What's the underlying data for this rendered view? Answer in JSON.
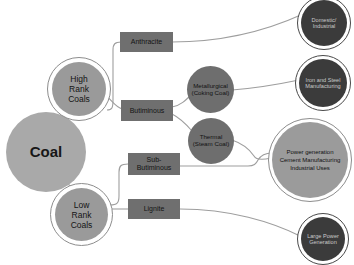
{
  "diagram": {
    "colors": {
      "root_fill": "#a9a9a9",
      "rank_fill": "#9a9a9a",
      "rect_fill": "#6f6f6f",
      "mid_circle_fill": "#6e6e6e",
      "dark_circle_fill": "#3b3b3b",
      "big_circle_fill": "#9b9b9b",
      "edge_stroke": "#9e9e9e",
      "ring_stroke": "#8d8d8d",
      "background": "#ffffff"
    },
    "nodes": {
      "root": {
        "label": "Coal"
      },
      "high_rank": {
        "line1": "High",
        "line2": "Rank",
        "line3": "Coals"
      },
      "low_rank": {
        "line1": "Low",
        "line2": "Rank",
        "line3": "Coals"
      },
      "anthracite": {
        "label": "Anthracite"
      },
      "bituminous": {
        "label": "Butiminous"
      },
      "sub_bituminous": {
        "line1": "Sub-",
        "line2": "Butiminous"
      },
      "lignite": {
        "label": "Lignite"
      },
      "metallurgical": {
        "line1": "Metallurgical",
        "line2": "(Coking Coal)"
      },
      "thermal": {
        "line1": "Thermal",
        "line2": "(Steam Coal)"
      },
      "domestic": {
        "line1": "Domestic/",
        "line2": "Industrial"
      },
      "iron_steel": {
        "line1": "Iron and Steel",
        "line2": "Manufacturing"
      },
      "power_cement": {
        "line1": "Power generation",
        "line2": "Cement Manufacturing",
        "line3": "Industrial Uses"
      },
      "large_power": {
        "line1": "Large Power",
        "line2": "Generation"
      }
    },
    "edges": [
      {
        "from": "root",
        "to": "high_rank"
      },
      {
        "from": "root",
        "to": "low_rank"
      },
      {
        "from": "high_rank",
        "to": "anthracite"
      },
      {
        "from": "high_rank",
        "to": "bituminous"
      },
      {
        "from": "low_rank",
        "to": "sub_bituminous"
      },
      {
        "from": "low_rank",
        "to": "lignite"
      },
      {
        "from": "bituminous",
        "to": "metallurgical"
      },
      {
        "from": "bituminous",
        "to": "thermal"
      },
      {
        "from": "anthracite",
        "to": "domestic"
      },
      {
        "from": "metallurgical",
        "to": "iron_steel"
      },
      {
        "from": "thermal",
        "to": "power_cement"
      },
      {
        "from": "sub_bituminous",
        "to": "power_cement"
      },
      {
        "from": "lignite",
        "to": "large_power"
      }
    ]
  }
}
